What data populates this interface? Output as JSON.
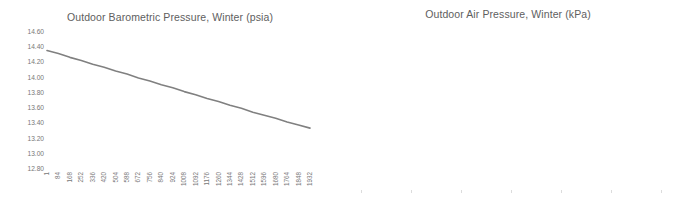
{
  "chart_data": [
    {
      "type": "line",
      "title": "Outdoor Barometric Pressure, Winter (psia)",
      "xlabel": "",
      "ylabel": "",
      "ylim": [
        12.8,
        14.6
      ],
      "xlim": [
        1,
        1932
      ],
      "grid": false,
      "legend": "none",
      "line_color": "#808080",
      "yticks": [
        "14.60",
        "14.40",
        "14.20",
        "14.00",
        "13.80",
        "13.60",
        "13.40",
        "13.20",
        "13.00",
        "12.80"
      ],
      "ytick_values": [
        14.6,
        14.4,
        14.2,
        14.0,
        13.8,
        13.6,
        13.4,
        13.2,
        13.0,
        12.8
      ],
      "categories": [
        "1",
        "84",
        "168",
        "252",
        "336",
        "420",
        "504",
        "588",
        "672",
        "756",
        "840",
        "924",
        "1008",
        "1092",
        "1176",
        "1260",
        "1344",
        "1428",
        "1512",
        "1596",
        "1680",
        "1764",
        "1848",
        "1932"
      ],
      "x": [
        1,
        84,
        168,
        252,
        336,
        420,
        504,
        588,
        672,
        756,
        840,
        924,
        1008,
        1092,
        1176,
        1260,
        1344,
        1428,
        1512,
        1596,
        1680,
        1764,
        1848,
        1932
      ],
      "values": [
        14.37,
        14.33,
        14.28,
        14.24,
        14.19,
        14.15,
        14.1,
        14.06,
        14.01,
        13.97,
        13.92,
        13.88,
        13.83,
        13.79,
        13.74,
        13.7,
        13.65,
        13.61,
        13.56,
        13.52,
        13.48,
        13.43,
        13.39,
        13.35
      ]
    },
    {
      "type": "line",
      "title": "Outdoor Air Pressure, Winter (kPa)",
      "xlabel": "",
      "ylabel": "",
      "ylim": [
        0,
        100
      ],
      "xlim": [
        100200,
        101400
      ],
      "grid": false,
      "legend": "none",
      "line_color": "#808080",
      "yticks": [
        "100",
        "90",
        "80",
        "70",
        "60",
        "50",
        "40",
        "30",
        "20",
        "10",
        "0"
      ],
      "ytick_values": [
        100,
        90,
        80,
        70,
        60,
        50,
        40,
        30,
        20,
        10,
        0
      ],
      "xticks": [
        "100,200",
        "100,400",
        "100,600",
        "100,800",
        "101,000",
        "101,200",
        "101,400"
      ],
      "xtick_values": [
        100200,
        100400,
        100600,
        100800,
        101000,
        101200,
        101400
      ],
      "x": [
        100250,
        101310
      ],
      "values": [
        88,
        0
      ]
    }
  ]
}
